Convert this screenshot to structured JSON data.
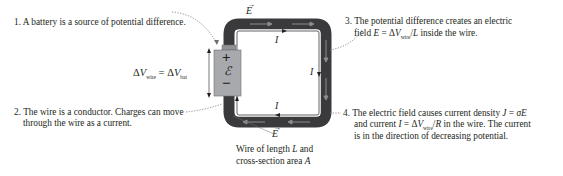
{
  "notes": {
    "n1": "1. A battery is a source of potential difference.",
    "n2_line1": "2. The wire is a conductor. Charges can move",
    "n2_line2": "through the wire as a current.",
    "n3_line1": "3. The potential difference creates an electric",
    "n3_line2_pre": "field ",
    "n3_line2_E": "E",
    "n3_line2_eq": " = Δ",
    "n3_line2_V": "V",
    "n3_line2_sub": "wire",
    "n3_line2_post": "/",
    "n3_line2_L": "L",
    "n3_line2_end": " inside the wire.",
    "n4_line1_pre": "4. The electric field causes current density ",
    "n4_line1_J": "J",
    "n4_line1_eq": " = ",
    "n4_line1_sigma": "σE",
    "n4_line2_pre": "and current ",
    "n4_line2_I": "I",
    "n4_line2_eq": " = Δ",
    "n4_line2_V": "V",
    "n4_line2_sub": "wire",
    "n4_line2_post": "/",
    "n4_line2_R": "R",
    "n4_line2_end": " in the wire. The current",
    "n4_line3": "is in the direction of decreasing potential."
  },
  "equation": {
    "lhs_delta": "Δ",
    "lhs_V": "V",
    "lhs_sub": "wire",
    "eq": " = Δ",
    "rhs_V": "V",
    "rhs_sub": "bat"
  },
  "battery": {
    "plus": "+",
    "emf": "ℰ",
    "minus": "−"
  },
  "wire_caption": {
    "line1_pre": "Wire of length ",
    "line1_L": "L",
    "line1_post": " and",
    "line2_pre": "cross-section area ",
    "line2_A": "A"
  },
  "labels": {
    "E_top": "E",
    "E_bottom": "E",
    "I_top": "I",
    "I_right": "I",
    "I_bottom": "I"
  },
  "colors": {
    "wire": "#3a3a3c",
    "battery_fill": "#a7a9ac",
    "battery_cap": "#8f9194",
    "text": "#231f20",
    "current_line": "#231f20"
  }
}
